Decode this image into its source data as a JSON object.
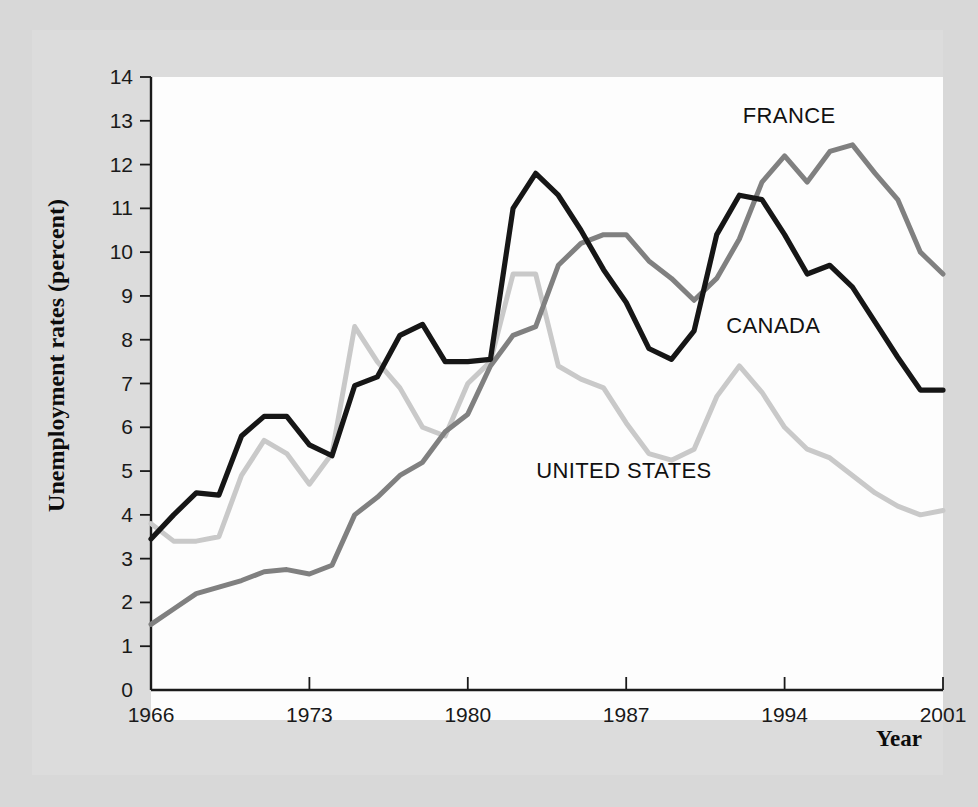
{
  "figure": {
    "background_color": "#dcdcdc",
    "page_color": "#d8d8d8",
    "plot_background": "#fdfdfd"
  },
  "axis_titles": {
    "y": "Unemployment rates (percent)",
    "x": "Year"
  },
  "series_labels": {
    "france": "FRANCE",
    "canada": "CANADA",
    "united_states": "UNITED STATES"
  },
  "colors": {
    "france": "#808080",
    "canada": "#161616",
    "united_states": "#c9c9c9",
    "axis": "#1a1a1a",
    "text": "#111111"
  },
  "chart_data": {
    "type": "line",
    "title": "",
    "xlabel": "Year",
    "ylabel": "Unemployment rates (percent)",
    "xlim": [
      1966,
      2001
    ],
    "ylim": [
      0,
      14
    ],
    "grid": false,
    "legend": "inline-annotations",
    "ytick_labels": [
      "0",
      "1",
      "2",
      "3",
      "4",
      "5",
      "6",
      "7",
      "8",
      "9",
      "10",
      "11",
      "12",
      "13",
      "14"
    ],
    "yticks": [
      0,
      1,
      2,
      3,
      4,
      5,
      6,
      7,
      8,
      9,
      10,
      11,
      12,
      13,
      14
    ],
    "xtick_labels": [
      "1966",
      "1973",
      "1980",
      "1987",
      "1994",
      "2001"
    ],
    "xticks": [
      1966,
      1973,
      1980,
      1987,
      1994,
      2001
    ],
    "x": [
      1966,
      1967,
      1968,
      1969,
      1970,
      1971,
      1972,
      1973,
      1974,
      1975,
      1976,
      1977,
      1978,
      1979,
      1980,
      1981,
      1982,
      1983,
      1984,
      1985,
      1986,
      1987,
      1988,
      1989,
      1990,
      1991,
      1992,
      1993,
      1994,
      1995,
      1996,
      1997,
      1998,
      1999,
      2000,
      2001
    ],
    "series": [
      {
        "name": "CANADA",
        "color": "#161616",
        "values": [
          3.45,
          4.0,
          4.5,
          4.45,
          5.8,
          6.25,
          6.25,
          5.6,
          5.35,
          6.95,
          7.15,
          8.1,
          8.35,
          7.5,
          7.5,
          7.55,
          11.0,
          11.8,
          11.3,
          10.5,
          9.6,
          8.85,
          7.8,
          7.55,
          8.2,
          10.4,
          11.3,
          11.2,
          10.4,
          9.5,
          9.7,
          9.2,
          8.4,
          7.6,
          6.85,
          6.85
        ]
      },
      {
        "name": "FRANCE",
        "color": "#808080",
        "values": [
          1.5,
          1.85,
          2.2,
          2.35,
          2.5,
          2.7,
          2.75,
          2.65,
          2.85,
          4.0,
          4.4,
          4.9,
          5.2,
          5.9,
          6.3,
          7.4,
          8.1,
          8.3,
          9.7,
          10.2,
          10.4,
          10.4,
          9.8,
          9.4,
          8.9,
          9.4,
          10.3,
          11.6,
          12.2,
          11.6,
          12.3,
          12.45,
          11.8,
          11.2,
          10.0,
          9.5
        ]
      },
      {
        "name": "UNITED STATES",
        "color": "#c9c9c9",
        "values": [
          3.8,
          3.4,
          3.4,
          3.5,
          4.9,
          5.7,
          5.4,
          4.7,
          5.4,
          8.3,
          7.5,
          6.9,
          6.0,
          5.8,
          7.0,
          7.5,
          9.5,
          9.5,
          7.4,
          7.1,
          6.9,
          6.1,
          5.4,
          5.25,
          5.5,
          6.7,
          7.4,
          6.8,
          6.0,
          5.5,
          5.3,
          4.9,
          4.5,
          4.2,
          4.0,
          4.1
        ]
      }
    ],
    "annotations": [
      {
        "text": "FRANCE",
        "x": 1994.2,
        "y": 12.95
      },
      {
        "text": "CANADA",
        "x": 1993.5,
        "y": 8.15
      },
      {
        "text": "UNITED STATES",
        "x": 1986.9,
        "y": 4.85
      }
    ]
  }
}
